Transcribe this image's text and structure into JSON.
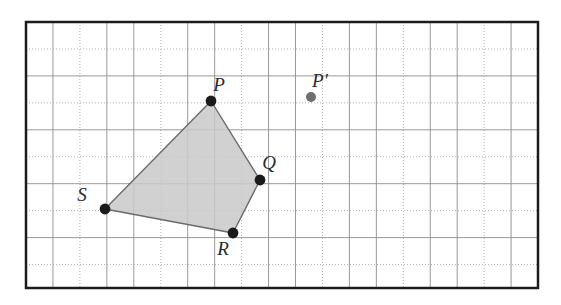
{
  "figure": {
    "kind": "geometry-grid-diagram",
    "canvas": {
      "width": 561,
      "height": 305
    },
    "colors": {
      "background": "#ffffff",
      "border": "#1c1c1c",
      "grid_solid": "#8d8d8d",
      "grid_dotted": "#a9a9a9",
      "shape_fill": "#c9c9c9",
      "shape_stroke": "#6b6b6b",
      "vertex_dot": "#1a1a1a",
      "image_point_dot": "#6e6e6e",
      "label_text": "#2b2b2b"
    }
  },
  "grid": {
    "left": 26,
    "top": 22,
    "right": 538,
    "bottom": 288,
    "cell_size": 26.95,
    "columns": 19,
    "rows": 10,
    "border_width": 2.5,
    "line_pattern": "alternating solid and dotted",
    "solid_line_width": 0.9,
    "dotted_line_width": 0.9,
    "dash_array": "1,2"
  },
  "shape": {
    "name": "quadrilateral-pqrs",
    "label": "PQRS",
    "fill_opacity": 0.85,
    "stroke_width": 1.4,
    "vertices": [
      {
        "id": "P",
        "label": "P",
        "x": 211,
        "y": 101,
        "dot_radius": 5.4,
        "label_dx": 8,
        "label_dy": -10
      },
      {
        "id": "Q",
        "label": "Q",
        "x": 260,
        "y": 180,
        "dot_radius": 5.4,
        "label_dx": 9,
        "label_dy": -11
      },
      {
        "id": "R",
        "label": "R",
        "x": 233,
        "y": 233,
        "dot_radius": 5.4,
        "label_dx": -10,
        "label_dy": 22
      },
      {
        "id": "S",
        "label": "S",
        "x": 105,
        "y": 209,
        "dot_radius": 5.4,
        "label_dx": -23,
        "label_dy": -8
      }
    ],
    "path": "M 211 101 L 260 180 L 233 233 L 105 209 Z"
  },
  "image_points": [
    {
      "id": "Pprime",
      "label": "P′",
      "x": 311,
      "y": 97,
      "dot_radius": 5.0,
      "label_dx": 9,
      "label_dy": -10
    }
  ],
  "labels": {
    "p": "P",
    "q": "Q",
    "r": "R",
    "s": "S",
    "p_prime": "P′"
  }
}
